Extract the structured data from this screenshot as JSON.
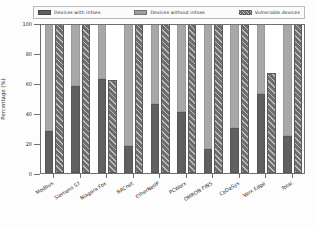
{
  "chart_data": {
    "type": "bar",
    "title": "",
    "xlabel": "",
    "ylabel": "Percentage (%)",
    "ylim": [
      0,
      100
    ],
    "yticks": [
      0,
      20,
      40,
      60,
      80,
      100
    ],
    "ytick_labels": [
      "0",
      "20",
      "40",
      "60",
      "80",
      "100"
    ],
    "grid": false,
    "legend_position": "upper center",
    "stacked_first_bar": true,
    "categories": [
      "Modbus",
      "Siemens S7",
      "Niagara Fox",
      "BACnet",
      "EtherNetIP",
      "PCWorx",
      "OMRON FINS",
      "CoDeSys",
      "Verx Edge",
      "Total"
    ],
    "series": [
      {
        "name": "Devices with infoes",
        "color": "#606060",
        "values": [
          28,
          58,
          63,
          18,
          46,
          41,
          16,
          30,
          53,
          25
        ]
      },
      {
        "name": "Devices without infoes",
        "color": "#a8a8a8",
        "values": [
          72,
          42,
          37,
          82,
          54,
          59,
          84,
          70,
          47,
          75
        ]
      },
      {
        "name": "Vulnerable devices",
        "color": "#6d6d6d",
        "hatch": "//",
        "values": [
          100,
          100,
          62,
          100,
          100,
          100,
          100,
          100,
          67,
          100
        ]
      }
    ]
  },
  "legend": {
    "items": [
      {
        "label": "Devices with infoes",
        "swatch": "s1"
      },
      {
        "label": "Devices without infoes",
        "swatch": "s2"
      },
      {
        "label": "Vulnerable devices",
        "swatch": "s3"
      }
    ]
  },
  "axis": {
    "y_title": "Percentage (%)"
  }
}
